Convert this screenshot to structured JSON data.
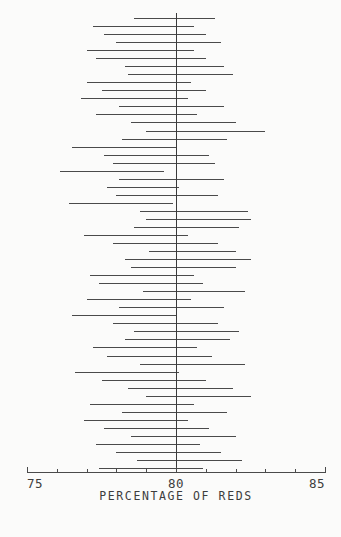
{
  "figure": {
    "background_color": "#fbfbfa",
    "line_color": "#4a4a4a",
    "reference_line_color": "#3a3a3a"
  },
  "axis": {
    "title": "PERCENTAGE OF REDS",
    "tick_labels": [
      "75",
      "80",
      "85"
    ],
    "tick_values": [
      75,
      80,
      85
    ],
    "minor_ticks_per_major": 5
  },
  "chart_data": {
    "type": "line",
    "title": "",
    "subtitle": "",
    "xlabel": "PERCENTAGE OF REDS",
    "ylabel": "",
    "xlim": [
      75,
      85
    ],
    "ylim": [
      0,
      57
    ],
    "grid": false,
    "legend": "none",
    "annotations": [
      {
        "type": "vertical-reference-line",
        "x": 80,
        "label": "80"
      }
    ],
    "series": [
      {
        "name": "confidence intervals",
        "orientation": "horizontal",
        "description": "Each horizontal segment is one simulated confidence interval for the percentage of reds; the vertical line marks the true value 80.",
        "intervals": [
          [
            78.6,
            81.3
          ],
          [
            77.2,
            80.6
          ],
          [
            77.6,
            81.0
          ],
          [
            78.0,
            81.5
          ],
          [
            77.0,
            80.6
          ],
          [
            77.3,
            81.0
          ],
          [
            78.3,
            81.6
          ],
          [
            78.4,
            81.9
          ],
          [
            77.0,
            80.5
          ],
          [
            77.5,
            81.0
          ],
          [
            76.8,
            80.4
          ],
          [
            78.1,
            81.6
          ],
          [
            77.3,
            80.7
          ],
          [
            78.5,
            82.0
          ],
          [
            79.0,
            83.0
          ],
          [
            78.2,
            81.7
          ],
          [
            76.5,
            80.0
          ],
          [
            77.6,
            81.1
          ],
          [
            77.9,
            81.3
          ],
          [
            76.1,
            79.6
          ],
          [
            78.1,
            81.6
          ],
          [
            77.7,
            80.1
          ],
          [
            78.0,
            81.4
          ],
          [
            76.4,
            79.9
          ],
          [
            78.8,
            82.4
          ],
          [
            79.0,
            82.5
          ],
          [
            78.6,
            82.1
          ],
          [
            76.9,
            80.4
          ],
          [
            77.9,
            81.4
          ],
          [
            79.1,
            82.0
          ],
          [
            78.3,
            82.5
          ],
          [
            78.5,
            82.0
          ],
          [
            77.1,
            80.6
          ],
          [
            77.4,
            80.9
          ],
          [
            78.9,
            82.3
          ],
          [
            77.0,
            80.5
          ],
          [
            78.1,
            81.6
          ],
          [
            76.5,
            80.0
          ],
          [
            77.9,
            81.4
          ],
          [
            78.6,
            82.1
          ],
          [
            78.3,
            81.8
          ],
          [
            77.2,
            80.7
          ],
          [
            77.7,
            81.2
          ],
          [
            78.8,
            82.3
          ],
          [
            76.6,
            80.1
          ],
          [
            77.5,
            81.0
          ],
          [
            78.4,
            81.9
          ],
          [
            79.0,
            82.5
          ],
          [
            77.1,
            80.6
          ],
          [
            78.2,
            81.7
          ],
          [
            76.9,
            80.4
          ],
          [
            77.6,
            81.1
          ],
          [
            78.5,
            82.0
          ],
          [
            77.3,
            80.8
          ],
          [
            78.0,
            81.5
          ],
          [
            78.7,
            82.2
          ],
          [
            77.4,
            80.9
          ]
        ]
      }
    ]
  }
}
